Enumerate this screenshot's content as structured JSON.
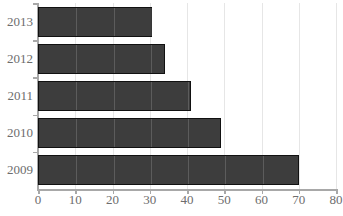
{
  "chart_data": {
    "type": "bar",
    "orientation": "horizontal",
    "title": "",
    "title_visible": false,
    "title_note": "chart title is cropped off the top edge of the screenshot and is not legible",
    "xlabel": "",
    "ylabel": "",
    "categories": [
      "2013",
      "2012",
      "2011",
      "2010",
      "2009"
    ],
    "values": [
      30.5,
      34,
      41,
      49,
      70
    ],
    "xlim": [
      0,
      80
    ],
    "xticks": [
      0,
      10,
      20,
      30,
      40,
      50,
      60,
      70,
      80
    ],
    "xtick_labels": [
      "0",
      "10",
      "20",
      "30",
      "40",
      "50",
      "60",
      "70",
      "80"
    ],
    "grid": true,
    "grid_axis": "x",
    "legend": false,
    "series": [
      {
        "name": "",
        "values": [
          30.5,
          34,
          41,
          49,
          70
        ]
      }
    ]
  },
  "style": {
    "bar_fill": "#3d3d3d",
    "bar_border": "#111111",
    "gridline_color": "#e6e6e6",
    "axis_color": "#a8a8a8",
    "tick_label_color": "#6d6d6d",
    "background": "#ffffff"
  }
}
